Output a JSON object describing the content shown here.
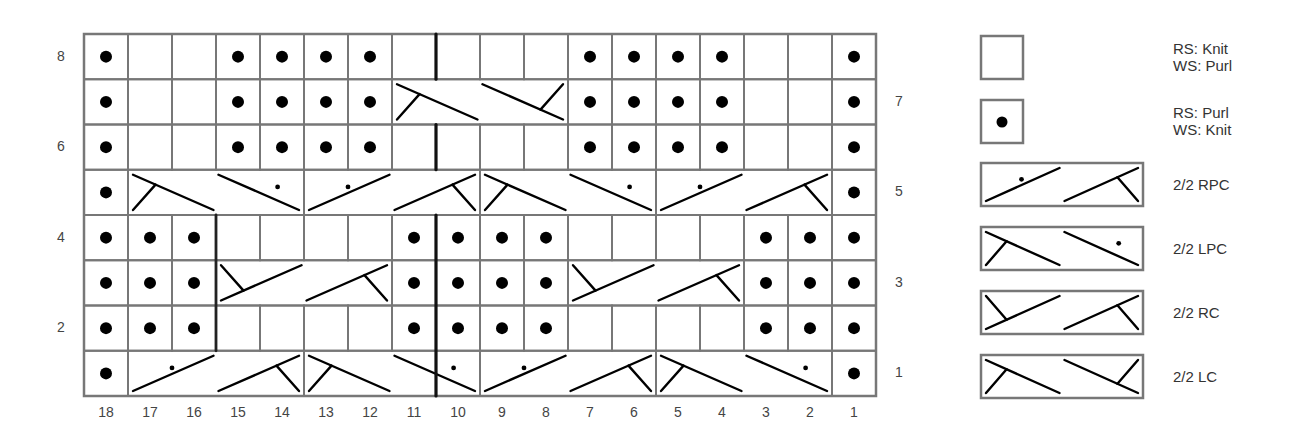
{
  "chart": {
    "columns": [
      18,
      17,
      16,
      15,
      14,
      13,
      12,
      11,
      10,
      9,
      8,
      7,
      6,
      5,
      4,
      3,
      2,
      1
    ],
    "row_labels_left": [
      "8",
      "6",
      "4",
      "2"
    ],
    "row_labels_right": [
      "7",
      "5",
      "3",
      "1"
    ],
    "rows": [
      {
        "row": 8,
        "cells": [
          "P",
          "K",
          "K",
          "P",
          "P",
          "P",
          "P",
          "K",
          "K",
          "K",
          "K",
          "P",
          "P",
          "P",
          "P",
          "K",
          "K",
          "P"
        ]
      },
      {
        "row": 7,
        "cells": [
          "P",
          "K",
          "K",
          "P",
          "P",
          "P",
          "P",
          {
            "cable": "2/2 LC",
            "span": 4
          },
          "P",
          "P",
          "P",
          "P",
          "K",
          "K",
          "P"
        ]
      },
      {
        "row": 6,
        "cells": [
          "P",
          "K",
          "K",
          "P",
          "P",
          "P",
          "P",
          "K",
          "K",
          "K",
          "K",
          "P",
          "P",
          "P",
          "P",
          "K",
          "K",
          "P"
        ]
      },
      {
        "row": 5,
        "cells": [
          "P",
          {
            "cable": "2/2 LPC",
            "span": 4
          },
          {
            "cable": "2/2 RPC",
            "span": 4
          },
          {
            "cable": "2/2 LPC",
            "span": 4
          },
          {
            "cable": "2/2 RPC",
            "span": 4
          },
          "P"
        ]
      },
      {
        "row": 4,
        "cells": [
          "P",
          "P",
          "P",
          "K",
          "K",
          "K",
          "K",
          "P",
          "P",
          "P",
          "P",
          "K",
          "K",
          "K",
          "K",
          "P",
          "P",
          "P"
        ]
      },
      {
        "row": 3,
        "cells": [
          "P",
          "P",
          "P",
          {
            "cable": "2/2 RC",
            "span": 4
          },
          "P",
          "P",
          "P",
          "P",
          {
            "cable": "2/2 RC",
            "span": 4
          },
          "P",
          "P",
          "P"
        ]
      },
      {
        "row": 2,
        "cells": [
          "P",
          "P",
          "P",
          "K",
          "K",
          "K",
          "K",
          "P",
          "P",
          "P",
          "P",
          "K",
          "K",
          "K",
          "K",
          "P",
          "P",
          "P"
        ]
      },
      {
        "row": 1,
        "cells": [
          "P",
          {
            "cable": "2/2 RPC",
            "span": 4
          },
          {
            "cable": "2/2 LPC",
            "span": 4
          },
          {
            "cable": "2/2 RPC",
            "span": 4
          },
          {
            "cable": "2/2 LPC",
            "span": 4
          },
          "P"
        ]
      }
    ]
  },
  "legend": [
    {
      "symbol": "knit",
      "label_line1": "RS: Knit",
      "label_line2": "WS: Purl"
    },
    {
      "symbol": "purl",
      "label_line1": "RS: Purl",
      "label_line2": "WS: Knit"
    },
    {
      "symbol": "rpc",
      "label_line1": "2/2 RPC"
    },
    {
      "symbol": "lpc",
      "label_line1": "2/2 LPC"
    },
    {
      "symbol": "rc",
      "label_line1": "2/2 RC"
    },
    {
      "symbol": "lc",
      "label_line1": "2/2 LC"
    }
  ],
  "colors": {
    "grid": "#777777",
    "ink": "#000000",
    "text": "#444444"
  }
}
